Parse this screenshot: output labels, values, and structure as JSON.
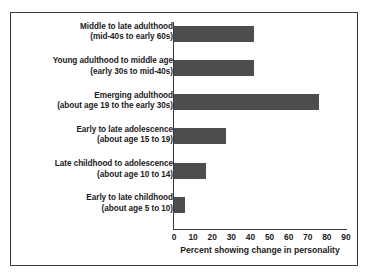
{
  "chart_data": {
    "type": "bar",
    "orientation": "horizontal",
    "title": "",
    "xlabel": "Percent showing change in personality",
    "ylabel": "",
    "xlim": [
      0,
      90
    ],
    "xticks": [
      0,
      10,
      20,
      30,
      40,
      50,
      60,
      70,
      80,
      90
    ],
    "grid": false,
    "legend": null,
    "bar_color": "#4d4d4d",
    "categories": [
      "Middle to late adulthood (mid-40s to early 60s)",
      "Young adulthood to middle age (early 30s to mid-40s)",
      "Emerging adulthood (about age 19 to the early 30s)",
      "Early to late adolescence (about age 15 to 19)",
      "Late childhood to adolescence (about age 10 to 14)",
      "Early to late childhood (about age 5 to 10)"
    ],
    "category_lines": [
      [
        "Middle to late adulthood",
        "(mid-40s to early 60s)"
      ],
      [
        "Young adulthood to middle age",
        "(early 30s to mid-40s)"
      ],
      [
        "Emerging adulthood",
        "(about age 19 to the early 30s)"
      ],
      [
        "Early to late adolescence",
        "(about age 15 to 19)"
      ],
      [
        "Late childhood to adolescence",
        "(about age 10 to 14)"
      ],
      [
        "Early to late childhood",
        "(about age 5 to 10)"
      ]
    ],
    "values": [
      42,
      42,
      76,
      27,
      17,
      6
    ]
  }
}
